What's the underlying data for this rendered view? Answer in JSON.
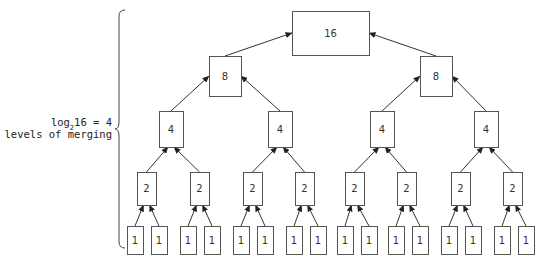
{
  "annotation": {
    "line1_prefix": "log",
    "line1_subscript": "2",
    "line1_suffix": "16 = 4",
    "line2": "levels of merging"
  },
  "tree": {
    "levels": [
      {
        "value": "16",
        "count": 1
      },
      {
        "value": "8",
        "count": 2
      },
      {
        "value": "4",
        "count": 4
      },
      {
        "value": "2",
        "count": 8
      },
      {
        "value": "1",
        "count": 16
      }
    ]
  },
  "nodes": [
    {
      "id": "n16",
      "label": "16",
      "x": 292,
      "y": 11,
      "w": 77,
      "h": 44
    },
    {
      "id": "n8a",
      "label": "8",
      "x": 209,
      "y": 56,
      "w": 32,
      "h": 40
    },
    {
      "id": "n8b",
      "label": "8",
      "x": 420,
      "y": 56,
      "w": 32,
      "h": 40
    },
    {
      "id": "n4a",
      "label": "4",
      "x": 159,
      "y": 111,
      "w": 24,
      "h": 36
    },
    {
      "id": "n4b",
      "label": "4",
      "x": 268,
      "y": 111,
      "w": 24,
      "h": 36
    },
    {
      "id": "n4c",
      "label": "4",
      "x": 370,
      "y": 111,
      "w": 24,
      "h": 36
    },
    {
      "id": "n4d",
      "label": "4",
      "x": 474,
      "y": 111,
      "w": 24,
      "h": 36
    },
    {
      "id": "n2a",
      "label": "2",
      "x": 137,
      "y": 172,
      "w": 19,
      "h": 33
    },
    {
      "id": "n2b",
      "label": "2",
      "x": 190,
      "y": 172,
      "w": 19,
      "h": 33
    },
    {
      "id": "n2c",
      "label": "2",
      "x": 243,
      "y": 172,
      "w": 19,
      "h": 33
    },
    {
      "id": "n2d",
      "label": "2",
      "x": 295,
      "y": 172,
      "w": 19,
      "h": 33
    },
    {
      "id": "n2e",
      "label": "2",
      "x": 345,
      "y": 172,
      "w": 19,
      "h": 33
    },
    {
      "id": "n2f",
      "label": "2",
      "x": 397,
      "y": 172,
      "w": 19,
      "h": 33
    },
    {
      "id": "n2g",
      "label": "2",
      "x": 451,
      "y": 172,
      "w": 19,
      "h": 33
    },
    {
      "id": "n2h",
      "label": "2",
      "x": 503,
      "y": 172,
      "w": 19,
      "h": 33
    },
    {
      "id": "n1a",
      "label": "1",
      "x": 127,
      "y": 226,
      "w": 16,
      "h": 28
    },
    {
      "id": "n1b",
      "label": "1",
      "x": 151,
      "y": 226,
      "w": 16,
      "h": 28
    },
    {
      "id": "n1c",
      "label": "1",
      "x": 180,
      "y": 226,
      "w": 16,
      "h": 28
    },
    {
      "id": "n1d",
      "label": "1",
      "x": 204,
      "y": 226,
      "w": 16,
      "h": 28
    },
    {
      "id": "n1e",
      "label": "1",
      "x": 233,
      "y": 226,
      "w": 16,
      "h": 28
    },
    {
      "id": "n1f",
      "label": "1",
      "x": 257,
      "y": 226,
      "w": 16,
      "h": 28
    },
    {
      "id": "n1g",
      "label": "1",
      "x": 286,
      "y": 226,
      "w": 16,
      "h": 28
    },
    {
      "id": "n1h",
      "label": "1",
      "x": 310,
      "y": 226,
      "w": 16,
      "h": 28
    },
    {
      "id": "n1i",
      "label": "1",
      "x": 337,
      "y": 226,
      "w": 16,
      "h": 28
    },
    {
      "id": "n1j",
      "label": "1",
      "x": 361,
      "y": 226,
      "w": 16,
      "h": 28
    },
    {
      "id": "n1k",
      "label": "1",
      "x": 388,
      "y": 226,
      "w": 16,
      "h": 28
    },
    {
      "id": "n1l",
      "label": "1",
      "x": 412,
      "y": 226,
      "w": 16,
      "h": 28
    },
    {
      "id": "n1m",
      "label": "1",
      "x": 441,
      "y": 226,
      "w": 16,
      "h": 28
    },
    {
      "id": "n1n",
      "label": "1",
      "x": 465,
      "y": 226,
      "w": 16,
      "h": 28
    },
    {
      "id": "n1o",
      "label": "1",
      "x": 494,
      "y": 226,
      "w": 16,
      "h": 28
    },
    {
      "id": "n1p",
      "label": "1",
      "x": 518,
      "y": 226,
      "w": 16,
      "h": 28
    }
  ],
  "edges": [
    [
      "n8a",
      "n16"
    ],
    [
      "n8b",
      "n16"
    ],
    [
      "n4a",
      "n8a"
    ],
    [
      "n4b",
      "n8a"
    ],
    [
      "n4c",
      "n8b"
    ],
    [
      "n4d",
      "n8b"
    ],
    [
      "n2a",
      "n4a"
    ],
    [
      "n2b",
      "n4a"
    ],
    [
      "n2c",
      "n4b"
    ],
    [
      "n2d",
      "n4b"
    ],
    [
      "n2e",
      "n4c"
    ],
    [
      "n2f",
      "n4c"
    ],
    [
      "n2g",
      "n4d"
    ],
    [
      "n2h",
      "n4d"
    ],
    [
      "n1a",
      "n2a"
    ],
    [
      "n1b",
      "n2a"
    ],
    [
      "n1c",
      "n2b"
    ],
    [
      "n1d",
      "n2b"
    ],
    [
      "n1e",
      "n2c"
    ],
    [
      "n1f",
      "n2c"
    ],
    [
      "n1g",
      "n2d"
    ],
    [
      "n1h",
      "n2d"
    ],
    [
      "n1i",
      "n2e"
    ],
    [
      "n1j",
      "n2e"
    ],
    [
      "n1k",
      "n2f"
    ],
    [
      "n1l",
      "n2f"
    ],
    [
      "n1m",
      "n2g"
    ],
    [
      "n1n",
      "n2g"
    ],
    [
      "n1o",
      "n2h"
    ],
    [
      "n1p",
      "n2h"
    ]
  ]
}
